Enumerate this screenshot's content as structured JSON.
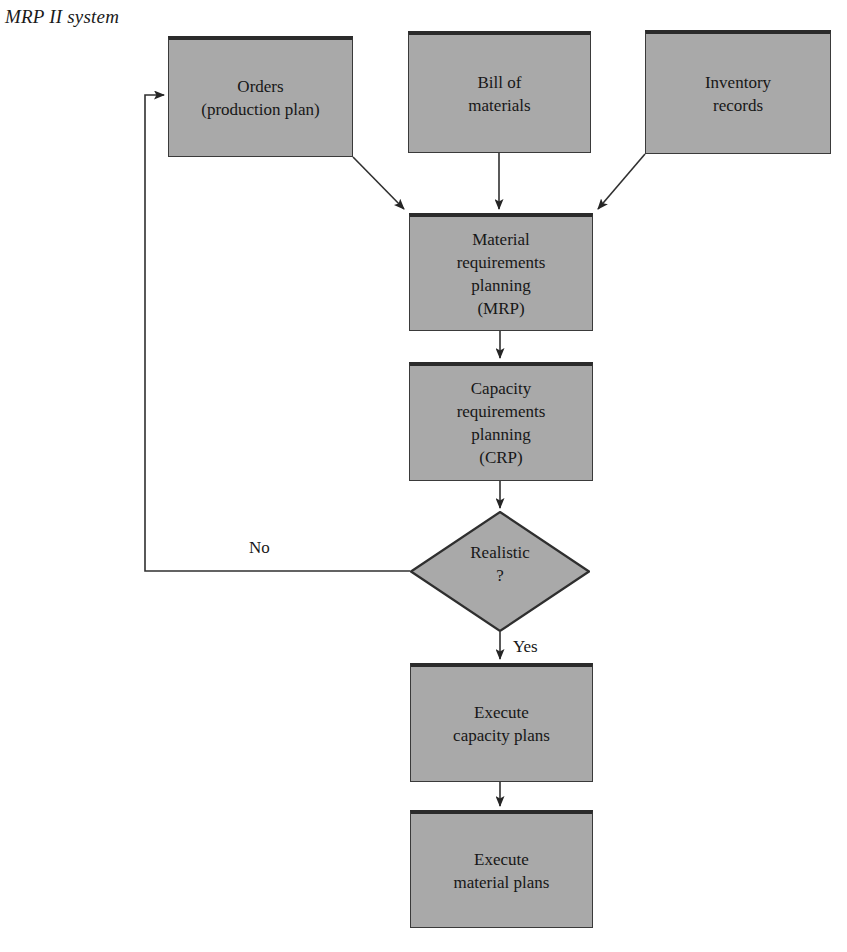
{
  "figure": {
    "title": "MRP II system",
    "caption": ""
  },
  "diagram": {
    "type": "flowchart",
    "orientation": "top-to-bottom",
    "nodes": [
      {
        "id": "orders",
        "shape": "rectangle",
        "label": "Orders\n(production plan)"
      },
      {
        "id": "bom",
        "shape": "rectangle",
        "label": "Bill of\nmaterials"
      },
      {
        "id": "inventory",
        "shape": "rectangle",
        "label": "Inventory\nrecords"
      },
      {
        "id": "mrp",
        "shape": "rectangle",
        "label": "Material\nrequirements\nplanning\n(MRP)"
      },
      {
        "id": "crp",
        "shape": "rectangle",
        "label": "Capacity\nrequirements\nplanning\n(CRP)"
      },
      {
        "id": "decision",
        "shape": "diamond",
        "label": "Realistic\n?"
      },
      {
        "id": "exec_capacity",
        "shape": "rectangle",
        "label": "Execute\ncapacity plans"
      },
      {
        "id": "exec_material",
        "shape": "rectangle",
        "label": "Execute\nmaterial plans"
      }
    ],
    "edges": [
      {
        "from": "orders",
        "to": "mrp",
        "label": ""
      },
      {
        "from": "bom",
        "to": "mrp",
        "label": ""
      },
      {
        "from": "inventory",
        "to": "mrp",
        "label": ""
      },
      {
        "from": "mrp",
        "to": "crp",
        "label": ""
      },
      {
        "from": "crp",
        "to": "decision",
        "label": ""
      },
      {
        "from": "decision",
        "to": "orders",
        "label": "No"
      },
      {
        "from": "decision",
        "to": "exec_capacity",
        "label": "Yes"
      },
      {
        "from": "exec_capacity",
        "to": "exec_material",
        "label": ""
      }
    ],
    "labels": {
      "no": "No",
      "yes": "Yes"
    },
    "colors": {
      "node_fill": "#a9a9a9",
      "node_border": "#3a3a3a",
      "node_top_border": "#2b2b2b",
      "connector": "#303030",
      "text": "#171717",
      "background": "#ffffff"
    }
  }
}
